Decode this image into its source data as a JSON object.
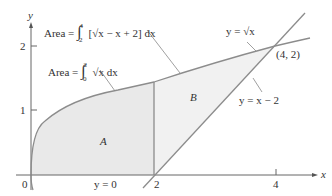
{
  "figure": {
    "axes": {
      "x_label": "x",
      "y_label": "y",
      "x_ticks": [
        {
          "value": 0,
          "label": "0"
        },
        {
          "value": 2,
          "label": "2"
        },
        {
          "value": 4,
          "label": "4"
        }
      ],
      "y_ticks": [
        {
          "value": 1,
          "label": "1"
        },
        {
          "value": 2,
          "label": "2"
        }
      ]
    },
    "curves": [
      {
        "name": "sqrt",
        "label": "y = √x"
      },
      {
        "name": "line",
        "label": "y = x − 2"
      },
      {
        "name": "xaxis",
        "label": "y = 0"
      }
    ],
    "regions": [
      {
        "name": "A",
        "label": "A"
      },
      {
        "name": "B",
        "label": "B"
      }
    ],
    "intersection": {
      "label": "(4, 2)"
    },
    "annotations": {
      "area_B_formula": {
        "prefix": "Area = ",
        "lower": "2",
        "upper": "4",
        "integrand": "[√x − x + 2] dx"
      },
      "area_A_formula": {
        "prefix": "Area = ",
        "lower": "0",
        "upper": "2",
        "integrand": "√x dx"
      }
    },
    "colors": {
      "curve": "#8c8c8c",
      "fill": "#e8e8e8",
      "axis": "#555555",
      "text": "#333333"
    }
  }
}
